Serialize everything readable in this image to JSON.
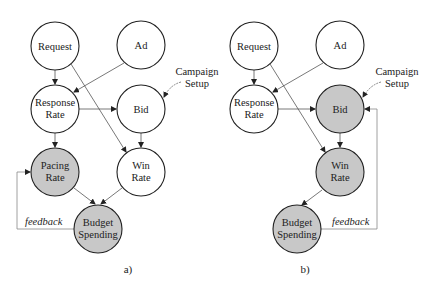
{
  "colors": {
    "filled": "#c8c8c8",
    "empty": "#ffffff",
    "stroke": "#222222",
    "edge": "#555555",
    "feedback": "#888888"
  },
  "diagram_a": {
    "caption": "a)",
    "nodes": {
      "request": {
        "l1": "Request",
        "l2": ""
      },
      "ad": {
        "l1": "Ad",
        "l2": ""
      },
      "response": {
        "l1": "Response",
        "l2": "Rate"
      },
      "bid": {
        "l1": "Bid",
        "l2": ""
      },
      "pacing": {
        "l1": "Pacing",
        "l2": "Rate"
      },
      "win": {
        "l1": "Win",
        "l2": "Rate"
      },
      "budget": {
        "l1": "Budget",
        "l2": "Spending"
      }
    },
    "campaign_l1": "Campaign",
    "campaign_l2": "Setup",
    "feedback": "feedback"
  },
  "diagram_b": {
    "caption": "b)",
    "nodes": {
      "request": {
        "l1": "Request",
        "l2": ""
      },
      "ad": {
        "l1": "Ad",
        "l2": ""
      },
      "response": {
        "l1": "Response",
        "l2": "Rate"
      },
      "bid": {
        "l1": "Bid",
        "l2": ""
      },
      "win": {
        "l1": "Win",
        "l2": "Rate"
      },
      "budget": {
        "l1": "Budget",
        "l2": "Spending"
      }
    },
    "campaign_l1": "Campaign",
    "campaign_l2": "Setup",
    "feedback": "feedback"
  }
}
